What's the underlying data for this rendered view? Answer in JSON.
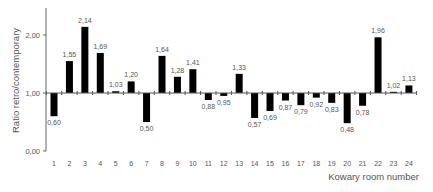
{
  "chart_data": {
    "type": "bar",
    "title": "",
    "xlabel": "Kowary room number",
    "ylabel": "Ratio retro/contemporary",
    "ylim": [
      0,
      2.5
    ],
    "baseline": 1.0,
    "yticks": [
      "0,00",
      "1,00",
      "2,00"
    ],
    "grid": false,
    "legend": null,
    "categories": [
      "1",
      "2",
      "3",
      "4",
      "5",
      "6",
      "7",
      "8",
      "9",
      "10",
      "11",
      "12",
      "13",
      "14",
      "15",
      "16",
      "17",
      "18",
      "19",
      "20",
      "21",
      "22",
      "23",
      "24"
    ],
    "values": [
      0.6,
      1.55,
      2.14,
      1.69,
      1.03,
      1.2,
      0.5,
      1.64,
      1.28,
      1.41,
      0.88,
      0.95,
      1.33,
      0.57,
      0.69,
      0.87,
      0.79,
      0.92,
      0.83,
      0.48,
      0.78,
      1.96,
      1.02,
      1.13
    ],
    "value_labels": [
      "0,60",
      "1,55",
      "2,14",
      "1,69",
      "1,03",
      "1,20",
      "0,50",
      "1,64",
      "1,28",
      "1,41",
      "0,88",
      "0,95",
      "1,33",
      "0,57",
      "0,69",
      "0,87",
      "0,79",
      "0,92",
      "0,83",
      "0,48",
      "0,78",
      "1,96",
      "1,02",
      "1,13"
    ],
    "bar_color": "#000000"
  }
}
